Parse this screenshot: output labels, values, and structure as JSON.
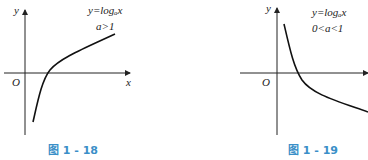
{
  "figures": [
    {
      "caption": "图 1 - 18",
      "equation": "y=logₐx",
      "condition": "a>1",
      "axis_x": "x",
      "axis_y": "y",
      "origin": "O"
    },
    {
      "caption": "图 1 - 19",
      "equation": "y=logₐx",
      "condition": "0<a<1",
      "axis_x": "x",
      "axis_y": "y",
      "origin": "O"
    }
  ],
  "colors": {
    "caption": "#3a8fc8",
    "curve": "#111111"
  }
}
